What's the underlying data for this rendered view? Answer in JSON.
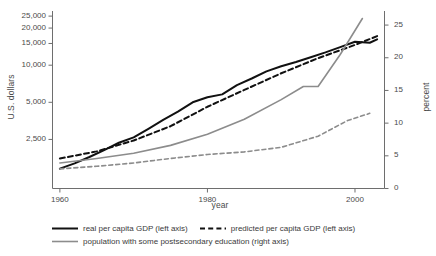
{
  "chart_data": {
    "type": "line",
    "title": "",
    "xlabel": "year",
    "ylabel_left": "U.S. dollars",
    "ylabel_right": "percent",
    "x_ticks": [
      "1960",
      "1980",
      "2000"
    ],
    "x_tick_values": [
      1960,
      1980,
      2000
    ],
    "xlim": [
      1959,
      2004
    ],
    "y_left_scale": "log",
    "y_left_ticks": [
      "2,500",
      "5,000",
      "10,000",
      "15,000",
      "20,000",
      "25,000"
    ],
    "y_left_tick_values": [
      2500,
      5000,
      10000,
      15000,
      20000,
      25000
    ],
    "y_left_lim": [
      1000,
      27000
    ],
    "y_right_scale": "linear",
    "y_right_ticks": [
      "0",
      "5",
      "10",
      "15",
      "20",
      "25"
    ],
    "y_right_tick_values": [
      0,
      5,
      10,
      15,
      20,
      25
    ],
    "y_right_lim": [
      0,
      27
    ],
    "grid": false,
    "legend_position": "below",
    "series": [
      {
        "name": "real per capita GDP (left axis)",
        "axis": "left",
        "style": "solid",
        "color": "#111111",
        "width": 2.0,
        "x": [
          1960,
          1962,
          1964,
          1966,
          1968,
          1970,
          1972,
          1974,
          1976,
          1978,
          1980,
          1982,
          1984,
          1986,
          1988,
          1990,
          1992,
          1994,
          1996,
          1998,
          2000,
          2002,
          2003
        ],
        "y": [
          1450,
          1600,
          1800,
          2050,
          2350,
          2600,
          3050,
          3600,
          4200,
          5000,
          5500,
          5800,
          6900,
          7800,
          8900,
          9800,
          10600,
          11600,
          12700,
          14000,
          15500,
          15200,
          16200
        ]
      },
      {
        "name": "predicted per capita GDP (left axis)",
        "axis": "left",
        "style": "dashed",
        "color": "#111111",
        "width": 2.0,
        "x": [
          1960,
          1965,
          1970,
          1975,
          1980,
          1985,
          1990,
          1995,
          2000,
          2003
        ],
        "y": [
          1750,
          2000,
          2450,
          3200,
          4600,
          6300,
          8600,
          11400,
          14600,
          17200
        ]
      },
      {
        "name": "population with some postsecondary education (right axis)",
        "axis": "right",
        "style": "solid",
        "color": "#8c8c8c",
        "width": 1.6,
        "x": [
          1960,
          1965,
          1970,
          1975,
          1980,
          1985,
          1990,
          1993,
          1995,
          1998,
          2001
        ],
        "y": [
          3.9,
          4.6,
          5.4,
          6.6,
          8.3,
          10.6,
          13.6,
          15.6,
          15.6,
          20.5,
          26.0
        ]
      },
      {
        "name": "population with some postsecondary education (predicted)",
        "axis": "right",
        "style": "dashed",
        "color": "#8c8c8c",
        "width": 1.6,
        "x": [
          1960,
          1965,
          1970,
          1975,
          1980,
          1985,
          1990,
          1995,
          1999,
          2002
        ],
        "y": [
          3.0,
          3.4,
          3.9,
          4.6,
          5.2,
          5.6,
          6.3,
          8.0,
          10.4,
          11.5
        ]
      }
    ],
    "legend": [
      {
        "label": "real per capita GDP (left axis)",
        "style": "solid",
        "color": "#111111",
        "width": 2.0
      },
      {
        "label": "predicted per capita GDP (left axis)",
        "style": "dashed",
        "color": "#111111",
        "width": 2.0
      },
      {
        "label": "population with some postsecondary education (right axis)",
        "style": "solid",
        "color": "#8c8c8c",
        "width": 1.6
      }
    ]
  },
  "axis_color": "#6e6e6e"
}
